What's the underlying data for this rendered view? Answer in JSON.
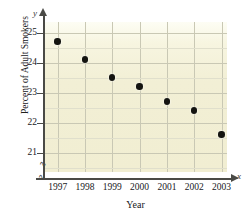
{
  "chart_data": {
    "type": "scatter",
    "title": "",
    "xlabel": "Year",
    "ylabel": "Percent of Adult Smokers",
    "x_var_label": "x",
    "y_var_label": "y",
    "categories": [
      "1997",
      "1998",
      "1999",
      "2000",
      "2001",
      "2002",
      "2003"
    ],
    "x": [
      1997,
      1998,
      1999,
      2000,
      2001,
      2002,
      2003
    ],
    "values": [
      24.7,
      24.1,
      23.5,
      23.2,
      22.7,
      22.4,
      21.6
    ],
    "xlim": [
      1996.5,
      2003.2
    ],
    "ylim": [
      20.35,
      25.35
    ],
    "y_ticks": [
      "21",
      "22",
      "23",
      "24",
      "25"
    ],
    "y_tick_values": [
      21,
      22,
      23,
      24,
      25
    ],
    "y_minor_step": 0.5,
    "grid": true,
    "legend": null,
    "axis_break_x": true,
    "axis_break_y": true,
    "plot_background_color": "#f1eed2",
    "gridline_color": "#c9c8b4",
    "point_color": "#141410",
    "axis_color": "#4a4a46"
  }
}
